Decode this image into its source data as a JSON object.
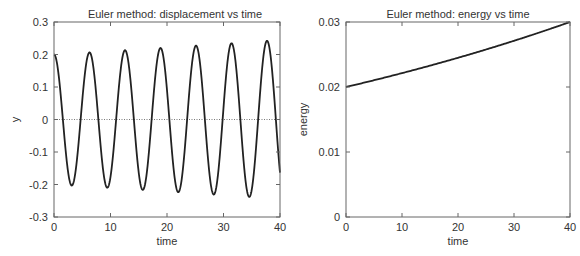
{
  "chart_data": [
    {
      "type": "line",
      "title": "Euler method:  displacement vs time",
      "xlabel": "time",
      "ylabel": "y",
      "xlim": [
        0,
        40
      ],
      "ylim": [
        -0.3,
        0.3
      ],
      "xticks": [
        0,
        10,
        20,
        30,
        40
      ],
      "yticks": [
        -0.3,
        -0.2,
        -0.1,
        0,
        0.1,
        0.2,
        0.3
      ],
      "xtick_labels": [
        "0",
        "10",
        "20",
        "30",
        "40"
      ],
      "ytick_labels": [
        "-0.3",
        "-0.2",
        "-0.1",
        "0",
        "0.1",
        "0.2",
        "0.3"
      ],
      "grid": false,
      "reference_line": {
        "y": 0,
        "style": "dotted"
      },
      "series": [
        {
          "name": "displacement",
          "description": "growing oscillation y = 0.2*cos(t)*(1.5)^(t/80)",
          "x": [
            0,
            3.14,
            6.28,
            9.42,
            12.57,
            15.71,
            18.85,
            21.99,
            25.13,
            28.27,
            31.42,
            34.56,
            37.7,
            40
          ],
          "y": [
            0.2,
            -0.205,
            0.21,
            -0.213,
            0.217,
            -0.22,
            0.224,
            -0.227,
            0.23,
            -0.233,
            0.237,
            -0.24,
            0.244,
            -0.163
          ]
        }
      ],
      "peaks": [
        0.2,
        0.206,
        0.212,
        0.219,
        0.225,
        0.232,
        0.24
      ],
      "troughs": [
        -0.204,
        -0.21,
        -0.217,
        -0.224,
        -0.231,
        -0.238
      ]
    },
    {
      "type": "line",
      "title": "Euler method:   energy vs time",
      "xlabel": "time",
      "ylabel": "energy",
      "xlim": [
        0,
        40
      ],
      "ylim": [
        0,
        0.03
      ],
      "xticks": [
        0,
        10,
        20,
        30,
        40
      ],
      "yticks": [
        0,
        0.01,
        0.02,
        0.03
      ],
      "xtick_labels": [
        "0",
        "10",
        "20",
        "30",
        "40"
      ],
      "ytick_labels": [
        "0",
        "0.01",
        "0.02",
        "0.03"
      ],
      "grid": false,
      "series": [
        {
          "name": "energy",
          "x": [
            0,
            5,
            10,
            15,
            20,
            25,
            30,
            35,
            40
          ],
          "y": [
            0.02,
            0.021,
            0.0221,
            0.0233,
            0.0245,
            0.0258,
            0.0271,
            0.0285,
            0.03
          ]
        }
      ]
    }
  ]
}
